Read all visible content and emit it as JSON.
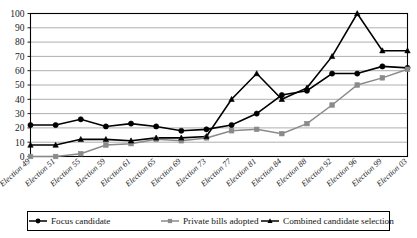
{
  "chart_data": {
    "type": "line",
    "title": "",
    "xlabel": "",
    "ylabel": "",
    "ylim": [
      0,
      100
    ],
    "ytick_step": 10,
    "grid": true,
    "legend_position": "bottom",
    "categories": [
      "Election 49",
      "Election 51",
      "Election 55",
      "Election 59",
      "Election 61",
      "Election 65",
      "Election 69",
      "Election 73",
      "Election 77",
      "Election 81",
      "Election 84",
      "Election 88",
      "Election 92",
      "Election 96",
      "Election 99",
      "Election 03"
    ],
    "yticks": [
      0,
      10,
      20,
      30,
      40,
      50,
      60,
      70,
      80,
      90,
      100
    ],
    "series": [
      {
        "name": "Focus candidate",
        "marker": "filled-circle",
        "color": "#000000",
        "values": [
          22,
          22,
          26,
          21,
          23,
          21,
          18,
          19,
          22,
          30,
          43,
          46,
          58,
          58,
          63,
          62
        ]
      },
      {
        "name": "Private bills adopted",
        "marker": "filled-square",
        "color": "#8a8a8a",
        "values": [
          0,
          0,
          2,
          8,
          9,
          12,
          11,
          13,
          18,
          19,
          16,
          23,
          36,
          50,
          55,
          61
        ]
      },
      {
        "name": "Combined candidate selection",
        "marker": "filled-triangle",
        "color": "#000000",
        "values": [
          8,
          8,
          12,
          12,
          11,
          13,
          13,
          14,
          40,
          58,
          40,
          48,
          70,
          100,
          74,
          74
        ]
      }
    ]
  },
  "legend": {
    "items": [
      {
        "label": "Focus candidate",
        "marker": "filled-circle"
      },
      {
        "label": "Private bills adopted",
        "marker": "filled-square"
      },
      {
        "label": "Combined candidate selection",
        "marker": "filled-triangle"
      }
    ]
  },
  "axis": {
    "y_labels": [
      "100",
      "90",
      "80",
      "70",
      "60",
      "50",
      "40",
      "30",
      "20",
      "10",
      "0"
    ]
  },
  "colors": {
    "dark_series": "#000000",
    "gray_series": "#8a8a8a",
    "grid": "#8e8e8e",
    "axis": "#000000",
    "background": "#ffffff"
  }
}
